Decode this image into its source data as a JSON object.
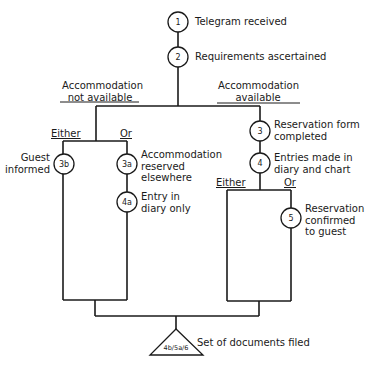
{
  "diagram": {
    "nodes": [
      {
        "id": "1",
        "label": "Telegram received"
      },
      {
        "id": "2",
        "label": "Requirements ascertained"
      },
      {
        "id": "3",
        "label_line1": "Reservation form",
        "label_line2": "completed"
      },
      {
        "id": "4",
        "label_line1": "Entries made in",
        "label_line2": "diary and chart"
      },
      {
        "id": "5",
        "label_line1": "Reservation",
        "label_line2": "confirmed",
        "label_line3": "to guest"
      },
      {
        "id": "3a",
        "label_line1": "Accommodation",
        "label_line2": "reserved",
        "label_line3": "elsewhere"
      },
      {
        "id": "4a",
        "label_line1": "Entry in",
        "label_line2": "diary only"
      },
      {
        "id": "3b",
        "label_line1": "Guest",
        "label_line2": "informed"
      }
    ],
    "branches": {
      "left": {
        "line1": "Accommodation",
        "line2": "not available"
      },
      "right": {
        "line1": "Accommodation",
        "line2": "available"
      }
    },
    "choice_labels": {
      "either": "Either",
      "or": "Or"
    },
    "terminal": {
      "symbol_label": "4b/5a/6",
      "label": "Set of documents filed"
    }
  }
}
